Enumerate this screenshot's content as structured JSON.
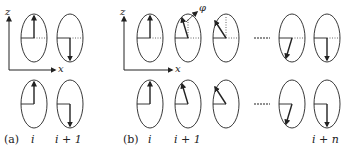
{
  "panels": [
    {
      "id": "a",
      "caption": "(a)",
      "axis": {
        "vertical": "z",
        "horizontal": "x"
      },
      "columns": [
        {
          "label": "i",
          "top_angle_deg": 0,
          "bottom_angle_deg": 0
        },
        {
          "label": "i + 1",
          "top_angle_deg": 180,
          "bottom_angle_deg": 180
        }
      ]
    },
    {
      "id": "b",
      "caption": "(b)",
      "axis": {
        "vertical": "z",
        "horizontal": "x"
      },
      "angle_symbol": "φ",
      "columns": [
        {
          "label": "i",
          "top_angle_deg": 0
        },
        {
          "label": "i + 1",
          "top_angle_deg": -20
        },
        {
          "label": "",
          "top_angle_deg": -40
        },
        {
          "label": "",
          "top_angle_deg": 160
        },
        {
          "label": "i + n",
          "top_angle_deg": 180
        }
      ],
      "ellipsis": "......"
    }
  ],
  "labels": {
    "a_caption": "(a)",
    "a_i": "i",
    "a_i1": "i + 1",
    "b_caption": "(b)",
    "b_i": "i",
    "b_i1": "i + 1",
    "b_in": "i + n",
    "z": "z",
    "x": "x",
    "phi": "φ"
  },
  "colors": {
    "stroke": "#222222",
    "dotted": "#555555"
  }
}
